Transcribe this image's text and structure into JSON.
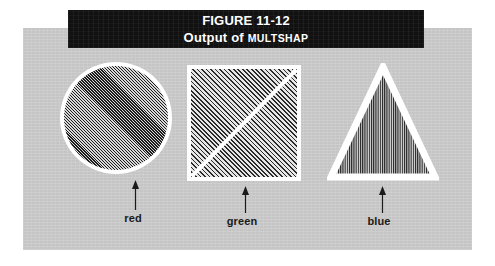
{
  "figure": {
    "caption": {
      "figure_number": "FIGURE 11-12",
      "title_prefix": "Output of",
      "title_procedure": "MULTSHAP"
    },
    "shapes": [
      {
        "name": "circle",
        "label": "red",
        "fill_pattern": "diagonal-hatch-fine",
        "outline_color": "#ffffff",
        "fill_color": "#6e6e6e"
      },
      {
        "name": "square",
        "label": "green",
        "fill_pattern": "diagonal-hatch-medium",
        "outline_color": "#ffffff",
        "fill_color": "#bdbdbd"
      },
      {
        "name": "triangle",
        "label": "blue",
        "fill_pattern": "vertical-hatch",
        "outline_color": "#ffffff",
        "fill_color": "#6e6e6e"
      }
    ],
    "colors": {
      "panel_background": "#c9c9c9",
      "caption_background": "#111111",
      "caption_text": "#ffffff",
      "page_background": "#ffffff",
      "label_text": "#1a1a1a"
    }
  }
}
